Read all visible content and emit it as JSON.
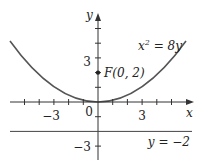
{
  "figure": {
    "x_axis_label": "x",
    "y_axis_label": "y",
    "x_ticks": {
      "neg3": "−3",
      "zero": "0",
      "pos3": "3"
    },
    "y_ticks": {
      "pos3": "3",
      "neg3": "−3"
    },
    "curve_label": {
      "lhs": "x",
      "exp": "2",
      "rhs": " = 8y"
    },
    "focus_label": "F(0, 2)",
    "directrix_label": "y = −2",
    "colors": {
      "curve": "#555555",
      "axis": "#333333",
      "text": "#222222"
    }
  }
}
